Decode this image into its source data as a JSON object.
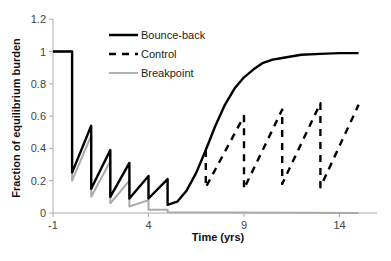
{
  "chart_data": {
    "type": "line",
    "title": "",
    "xlabel": "Time (yrs)",
    "ylabel": "Fraction of equilibrium burden",
    "xlim": [
      -1,
      16
    ],
    "ylim": [
      0,
      1.2
    ],
    "xticks": [
      -1,
      4,
      9,
      14
    ],
    "yticks": [
      0,
      0.2,
      0.4,
      0.6,
      0.8,
      1,
      1.2
    ],
    "ytick_labels": [
      "0",
      "0.2",
      "0.4",
      "0.6",
      "0.8",
      "1",
      "1.2"
    ],
    "grid": false,
    "legend_position": "upper-left-inside",
    "series": [
      {
        "name": "Bounce-back",
        "color": "#000000",
        "style": "solid",
        "points": [
          [
            -1,
            1
          ],
          [
            0,
            1
          ],
          [
            0,
            0.25
          ],
          [
            1,
            0.54
          ],
          [
            1,
            0.15
          ],
          [
            2,
            0.39
          ],
          [
            2,
            0.1
          ],
          [
            3,
            0.31
          ],
          [
            3,
            0.09
          ],
          [
            4,
            0.23
          ],
          [
            4,
            0.09
          ],
          [
            5,
            0.21
          ],
          [
            5,
            0.05
          ],
          [
            5.5,
            0.07
          ],
          [
            6,
            0.14
          ],
          [
            6.5,
            0.25
          ],
          [
            7,
            0.39
          ],
          [
            7.5,
            0.54
          ],
          [
            8,
            0.67
          ],
          [
            8.5,
            0.77
          ],
          [
            9,
            0.84
          ],
          [
            9.5,
            0.89
          ],
          [
            10,
            0.93
          ],
          [
            10.5,
            0.95
          ],
          [
            11,
            0.96
          ],
          [
            12,
            0.98
          ],
          [
            13,
            0.985
          ],
          [
            14,
            0.99
          ],
          [
            15,
            0.99
          ]
        ]
      },
      {
        "name": "Control",
        "color": "#000000",
        "style": "dashed",
        "points": [
          [
            7,
            0.39
          ],
          [
            7,
            0.16
          ],
          [
            9,
            0.6
          ],
          [
            9,
            0.15
          ],
          [
            11,
            0.64
          ],
          [
            11,
            0.18
          ],
          [
            13,
            0.68
          ],
          [
            13,
            0.16
          ],
          [
            15,
            0.67
          ]
        ]
      },
      {
        "name": "Breakpoint",
        "color": "#aaaaaa",
        "style": "solid",
        "points": [
          [
            -1,
            1
          ],
          [
            0,
            1
          ],
          [
            0,
            0.2
          ],
          [
            1,
            0.48
          ],
          [
            1,
            0.1
          ],
          [
            2,
            0.32
          ],
          [
            2,
            0.06
          ],
          [
            3,
            0.2
          ],
          [
            3,
            0.04
          ],
          [
            4,
            0.08
          ],
          [
            4,
            0.02
          ],
          [
            5,
            0.02
          ],
          [
            5,
            0.005
          ],
          [
            15,
            0.0
          ]
        ]
      }
    ]
  },
  "legend": {
    "items": [
      {
        "label": "Bounce-back"
      },
      {
        "label": "Control"
      },
      {
        "label": "Breakpoint"
      }
    ]
  },
  "axes": {
    "xlabel": "Time (yrs)",
    "ylabel": "Fraction of equilibrium burden"
  }
}
